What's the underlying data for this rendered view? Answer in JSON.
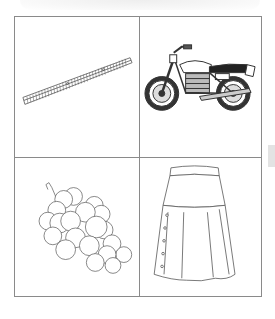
{
  "worksheet": {
    "layout": "2x2 picture grid",
    "cells": [
      {
        "position": "top-left",
        "picture": "ruler",
        "label": ""
      },
      {
        "position": "top-right",
        "picture": "motorcycle",
        "label": ""
      },
      {
        "position": "bottom-left",
        "picture": "grapes",
        "label": ""
      },
      {
        "position": "bottom-right",
        "picture": "skirt",
        "label": ""
      }
    ]
  },
  "colors": {
    "border": "#8a8a8a",
    "line_art": "#555555",
    "side_tab": "#e3e3e3"
  }
}
